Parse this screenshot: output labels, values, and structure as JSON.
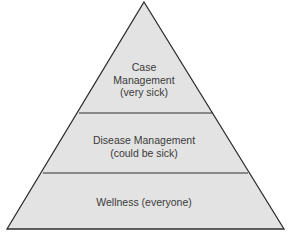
{
  "diagram": {
    "type": "pyramid",
    "colors": {
      "fill": "#e3e3e3",
      "stroke": "#2e2e2e",
      "text": "#3a3a3a"
    },
    "tiers": [
      {
        "level": "top",
        "lines": [
          "Case",
          "Management",
          "(very sick)"
        ]
      },
      {
        "level": "middle",
        "lines": [
          "Disease Management",
          "(could be sick)"
        ]
      },
      {
        "level": "bottom",
        "lines": [
          "Wellness (everyone)"
        ]
      }
    ]
  }
}
